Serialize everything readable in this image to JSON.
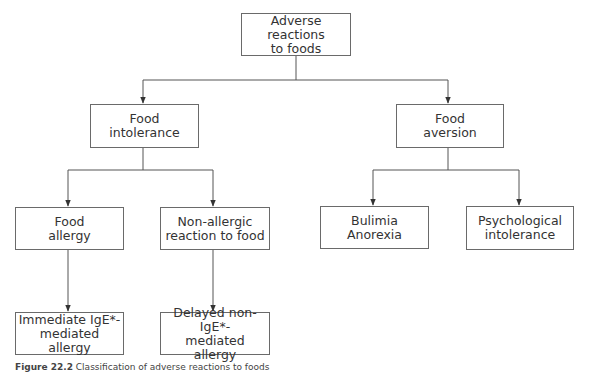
{
  "diagram": {
    "root": {
      "label": "Adverse reactions\nto foods"
    },
    "level1": [
      {
        "label": "Food\nintolerance"
      },
      {
        "label": "Food\naversion"
      }
    ],
    "level2": [
      {
        "label": "Food\nallergy"
      },
      {
        "label": "Non-allergic\nreaction to food"
      },
      {
        "label": "Bulimia\nAnorexia"
      },
      {
        "label": "Psychological\nintolerance"
      }
    ],
    "level3": [
      {
        "label": "Immediate IgE*-\nmediated allergy"
      },
      {
        "label": "Delayed non-IgE*-\nmediated allergy"
      }
    ],
    "line_color": "#555555",
    "box_border_color": "#6a6a6a"
  },
  "caption": {
    "number": "Figure 22.2",
    "text": " Classification of adverse reactions to foods"
  }
}
